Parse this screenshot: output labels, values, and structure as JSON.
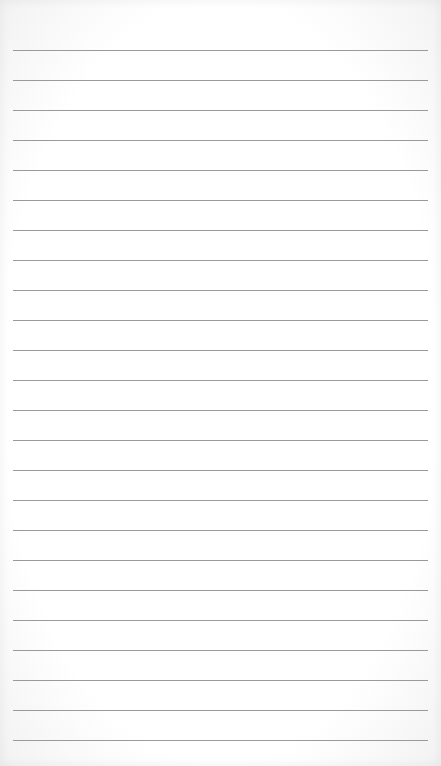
{
  "paper": {
    "type": "lined-notepad",
    "line_count": 24,
    "first_line_y": 50,
    "line_spacing": 30,
    "line_left": 13,
    "line_width": 415,
    "line_color": "#9a9a9a",
    "background_color": "#ffffff"
  }
}
